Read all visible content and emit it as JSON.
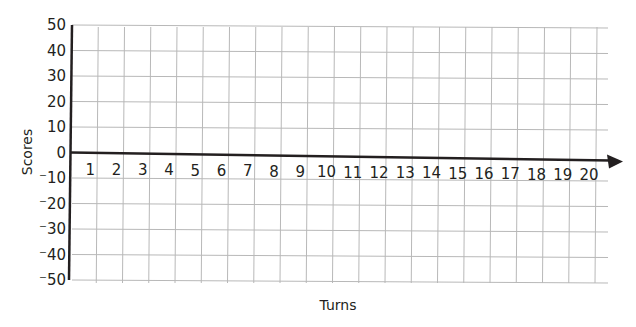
{
  "chart_data": {
    "type": "line",
    "title": "",
    "xlabel": "Turns",
    "ylabel": "Scores",
    "x_ticks": [
      "1",
      "2",
      "3",
      "4",
      "5",
      "6",
      "7",
      "8",
      "9",
      "10",
      "11",
      "12",
      "13",
      "14",
      "15",
      "16",
      "17",
      "18",
      "19",
      "20"
    ],
    "y_ticks": [
      "50",
      "40",
      "30",
      "20",
      "10",
      "0",
      "⁻10",
      "⁻20",
      "⁻30",
      "⁻40",
      "⁻50"
    ],
    "y_values": [
      50,
      40,
      30,
      20,
      10,
      0,
      -10,
      -20,
      -30,
      -40,
      -50
    ],
    "xlim": [
      0,
      20
    ],
    "ylim": [
      -50,
      50
    ],
    "grid": true,
    "series": [],
    "x_axis_arrow": true
  },
  "colors": {
    "axis": "#231f20",
    "grid": "#b8b8b8",
    "text": "#231f20"
  },
  "layout": {
    "origin_x": 72,
    "zero_y": 152,
    "top_y": 25,
    "bottom_y": 280,
    "col_spacing": 26.25,
    "row_spacing": 25.5,
    "grid_right": 608,
    "arrow_tip_x": 623
  }
}
